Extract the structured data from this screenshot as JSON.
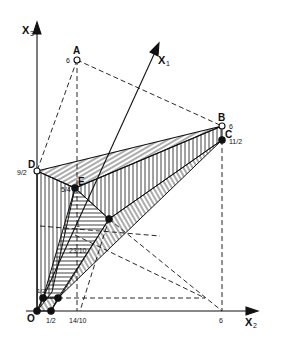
{
  "figure": {
    "axes": {
      "x1_label": "X",
      "x1_sub": "1",
      "x2_label": "X",
      "x2_sub": "2",
      "x3_label": "X",
      "x3_sub": "3"
    },
    "points": {
      "A": {
        "label": "A",
        "value": "6"
      },
      "B": {
        "label": "B",
        "value": "6"
      },
      "C": {
        "label": "C",
        "value": "11/2"
      },
      "D": {
        "label": "D",
        "value": "9/2"
      },
      "E": {
        "label": "E",
        "value": "5/4"
      },
      "O": {
        "label": "O"
      }
    },
    "tick_labels": {
      "half": "1/2",
      "fourteen_tenths": "14/10",
      "six": "6",
      "twenty_three_tenths": "23/10",
      "one": "1",
      "half_x3": "1/2"
    }
  }
}
